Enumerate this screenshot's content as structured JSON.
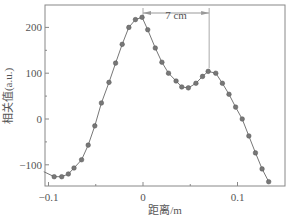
{
  "chart_data": {
    "type": "line",
    "title": "",
    "xlabel": "距离/m",
    "ylabel": "相关值(a.u.)",
    "xlim": [
      -0.1,
      0.145
    ],
    "ylim": [
      -150,
      250
    ],
    "xticks": [
      -0.1,
      0,
      0.1
    ],
    "xtick_labels": [
      "-0.1",
      "0",
      "0.1"
    ],
    "yticks": [
      -100,
      0,
      100,
      200
    ],
    "ytick_labels": [
      "-100",
      "0",
      "100",
      "200"
    ],
    "grid": false,
    "legend": null,
    "series": [
      {
        "name": "相关值",
        "marker": "circle",
        "x": [
          -0.105,
          -0.094,
          -0.086,
          -0.079,
          -0.073,
          -0.065,
          -0.058,
          -0.051,
          -0.044,
          -0.036,
          -0.029,
          -0.022,
          -0.015,
          -0.008,
          -0.001,
          0.005,
          0.013,
          0.02,
          0.027,
          0.035,
          0.041,
          0.048,
          0.056,
          0.063,
          0.069,
          0.077,
          0.084,
          0.091,
          0.098,
          0.105,
          0.112,
          0.119,
          0.126,
          0.133
        ],
        "values": [
          -115,
          -126,
          -126,
          -120,
          -107,
          -89,
          -57,
          -15,
          35,
          80,
          122,
          163,
          200,
          217,
          222,
          195,
          155,
          124,
          100,
          83,
          70,
          68,
          78,
          93,
          104,
          100,
          78,
          54,
          26,
          0,
          -37,
          -74,
          -109,
          -137
        ]
      }
    ],
    "annotations": [
      {
        "type": "double-arrow",
        "text": "7 cm",
        "x_from": 0.0,
        "x_to": 0.07,
        "y": 235
      },
      {
        "type": "vline",
        "x": 0.07,
        "y_from": 104,
        "y_to": 240
      },
      {
        "type": "vline",
        "x": 0.0,
        "y_from": 222,
        "y_to": 240
      }
    ]
  },
  "labels": {
    "xlabel": "距离/m",
    "ylabel": "相关值(a.u.)",
    "annotation": "7 cm"
  }
}
